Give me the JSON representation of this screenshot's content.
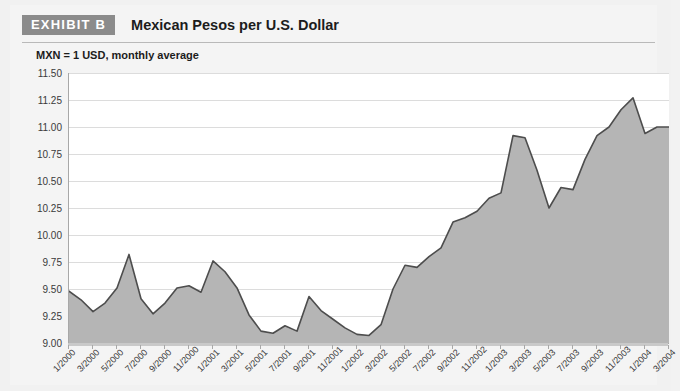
{
  "header": {
    "badge_label": "EXHIBIT B",
    "title": "Mexican Pesos per U.S. Dollar"
  },
  "subtitle": "MXN = 1 USD, monthly average",
  "colors": {
    "badge_background": "#8b8b8b",
    "badge_text": "#ffffff",
    "area_fill": "#b5b5b5",
    "line_stroke": "#4d4d4d",
    "gridline": "#dcdcdc",
    "axis": "#a8a8a8",
    "plot_background": "#ffffff",
    "page_background": "#f1f1f1"
  },
  "chart_data": {
    "type": "area",
    "title": "Mexican Pesos per U.S. Dollar",
    "subtitle": "MXN = 1 USD, monthly average",
    "xlabel": "",
    "ylabel": "",
    "ylim": [
      9.0,
      11.5
    ],
    "ytick_step": 0.25,
    "ytick_labels": [
      "11.50",
      "11.25",
      "11.00",
      "10.75",
      "10.50",
      "10.25",
      "10.00",
      "9.75",
      "9.50",
      "9.25",
      "9.00"
    ],
    "ytick_values": [
      11.5,
      11.25,
      11.0,
      10.75,
      10.5,
      10.25,
      10.0,
      9.75,
      9.5,
      9.25,
      9.0
    ],
    "grid": true,
    "legend": "none",
    "xtick_labels": [
      "1/2000",
      "3/2000",
      "5/2000",
      "7/2000",
      "9/2000",
      "11/2000",
      "1/2001",
      "3/2001",
      "5/2001",
      "7/2001",
      "9/2001",
      "11/2001",
      "1/2002",
      "3/2002",
      "5/2002",
      "7/2002",
      "9/2002",
      "11/2002",
      "1/2003",
      "3/2003",
      "5/2003",
      "7/2003",
      "9/2003",
      "11/2003",
      "1/2004",
      "3/2004"
    ],
    "xtick_interval_months": 2,
    "categories": [
      "1/2000",
      "2/2000",
      "3/2000",
      "4/2000",
      "5/2000",
      "6/2000",
      "7/2000",
      "8/2000",
      "9/2000",
      "10/2000",
      "11/2000",
      "12/2000",
      "1/2001",
      "2/2001",
      "3/2001",
      "4/2001",
      "5/2001",
      "6/2001",
      "7/2001",
      "8/2001",
      "9/2001",
      "10/2001",
      "11/2001",
      "12/2001",
      "1/2002",
      "2/2002",
      "3/2002",
      "4/2002",
      "5/2002",
      "6/2002",
      "7/2002",
      "8/2002",
      "9/2002",
      "10/2002",
      "11/2002",
      "12/2002",
      "1/2003",
      "2/2003",
      "3/2003",
      "4/2003",
      "5/2003",
      "6/2003",
      "7/2003",
      "8/2003",
      "9/2003",
      "10/2003",
      "11/2003",
      "12/2003",
      "1/2004",
      "2/2004",
      "3/2004"
    ],
    "values": [
      9.48,
      9.4,
      9.29,
      9.37,
      9.51,
      9.82,
      9.41,
      9.27,
      9.37,
      9.51,
      9.53,
      9.47,
      9.76,
      9.66,
      9.51,
      9.26,
      9.11,
      9.09,
      9.16,
      9.11,
      9.43,
      9.3,
      9.22,
      9.14,
      9.08,
      9.07,
      9.17,
      9.5,
      9.72,
      9.7,
      9.8,
      9.88,
      10.12,
      10.16,
      10.22,
      10.34,
      10.39,
      10.92,
      10.9,
      10.6,
      10.25,
      10.44,
      10.42,
      10.7,
      10.92,
      11.0,
      11.16,
      11.27,
      10.94,
      11.0,
      11.0
    ]
  }
}
